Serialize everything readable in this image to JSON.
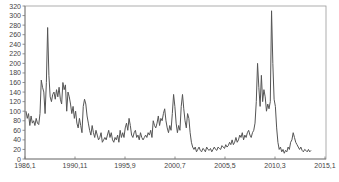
{
  "chart_data": {
    "type": "line",
    "title": "",
    "xlabel": "",
    "ylabel": "",
    "ylim": [
      0,
      320
    ],
    "yticks": [
      0,
      20,
      40,
      60,
      80,
      100,
      120,
      140,
      160,
      180,
      200,
      220,
      240,
      260,
      280,
      300,
      320
    ],
    "xtick_labels": [
      "1986,1",
      "1990,11",
      "1995,9",
      "2000,7",
      "2005,5",
      "2010,3",
      "2015,1"
    ],
    "grid": false,
    "legend": null,
    "line_color": "#555555",
    "series": [
      {
        "name": "series",
        "values": [
          100,
          85,
          95,
          70,
          90,
          75,
          80,
          70,
          85,
          75,
          72,
          95,
          165,
          150,
          140,
          95,
          160,
          275,
          175,
          130,
          120,
          135,
          140,
          125,
          145,
          130,
          150,
          125,
          115,
          160,
          145,
          155,
          100,
          140,
          130,
          115,
          95,
          110,
          85,
          100,
          75,
          65,
          85,
          70,
          55,
          110,
          125,
          115,
          90,
          75,
          60,
          50,
          70,
          55,
          45,
          60,
          50,
          40,
          45,
          55,
          35,
          40,
          45,
          40,
          50,
          60,
          45,
          55,
          40,
          35,
          45,
          40,
          50,
          35,
          60,
          45,
          55,
          45,
          65,
          75,
          60,
          85,
          70,
          50,
          45,
          55,
          60,
          45,
          50,
          40,
          55,
          45,
          40,
          45,
          50,
          45,
          55,
          50,
          60,
          45,
          80,
          70,
          65,
          75,
          90,
          70,
          85,
          80,
          95,
          105,
          80,
          65,
          55,
          70,
          60,
          95,
          135,
          110,
          75,
          55,
          70,
          60,
          110,
          135,
          105,
          80,
          65,
          95,
          85,
          55,
          35,
          25,
          20,
          25,
          15,
          20,
          25,
          18,
          15,
          22,
          20,
          15,
          25,
          20,
          18,
          22,
          15,
          20,
          25,
          20,
          18,
          25,
          22,
          20,
          28,
          25,
          22,
          30,
          25,
          28,
          35,
          30,
          40,
          30,
          35,
          45,
          35,
          40,
          50,
          45,
          55,
          40,
          50,
          45,
          55,
          60,
          50,
          45,
          55,
          60,
          75,
          120,
          200,
          150,
          110,
          175,
          120,
          145,
          130,
          100,
          115,
          105,
          120,
          310,
          200,
          125,
          110,
          65,
          35,
          20,
          25,
          15,
          20,
          12,
          18,
          15,
          25,
          20,
          35,
          40,
          55,
          45,
          35,
          30,
          25,
          20,
          25,
          18,
          15,
          20,
          18,
          15,
          20,
          15,
          18
        ]
      }
    ]
  }
}
